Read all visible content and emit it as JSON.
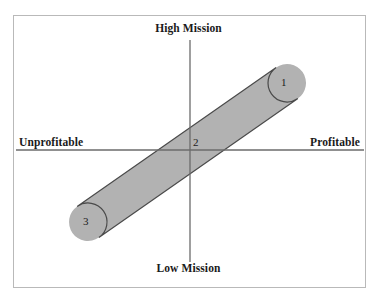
{
  "figure": {
    "name": "mission-profitability-matrix",
    "background_color": "#ffffff",
    "frame_color": "#b9b9b9"
  },
  "axes": {
    "vertical": {
      "top_label": "High Mission",
      "bottom_label": "Low Mission",
      "x": 190,
      "y_top": 40,
      "y_bottom": 262,
      "color": "#6b6b6b"
    },
    "horizontal": {
      "left_label": "Unprofitable",
      "right_label": "Profitable",
      "y": 150,
      "x_left": 16,
      "x_right": 364,
      "color": "#6b6b6b"
    }
  },
  "band": {
    "type": "capsule",
    "fill_color": "#b2b2b2",
    "stroke_color": "#4a4a4a",
    "start_x": 88,
    "start_y": 222,
    "end_x": 287,
    "end_y": 83,
    "thickness": 38
  },
  "region_labels": [
    {
      "text": "1",
      "position": "upper-right"
    },
    {
      "text": "2",
      "position": "center-origin"
    },
    {
      "text": "3",
      "position": "lower-left"
    }
  ],
  "chart_data": {
    "type": "scatter",
    "title": "",
    "xlabel": "",
    "ylabel": "",
    "x_axis": {
      "negative_label": "Unprofitable",
      "positive_label": "Profitable"
    },
    "y_axis": {
      "negative_label": "Low Mission",
      "positive_label": "High Mission"
    },
    "grid": false,
    "legend": "none",
    "annotations": [
      {
        "label": "1",
        "quadrant": "high-mission-profitable",
        "x": 0.72,
        "y": 0.63
      },
      {
        "label": "2",
        "quadrant": "origin",
        "x": 0.04,
        "y": 0.04
      },
      {
        "label": "3",
        "quadrant": "low-mission-unprofitable",
        "x": -0.64,
        "y": -0.57
      }
    ],
    "series": [
      {
        "name": "mission-profitability-band",
        "shape": "diagonal-capsule",
        "points": [
          {
            "label": "3",
            "x": -0.64,
            "y": -0.57
          },
          {
            "label": "2",
            "x": 0.04,
            "y": 0.04
          },
          {
            "label": "1",
            "x": 0.72,
            "y": 0.63
          }
        ]
      }
    ]
  }
}
